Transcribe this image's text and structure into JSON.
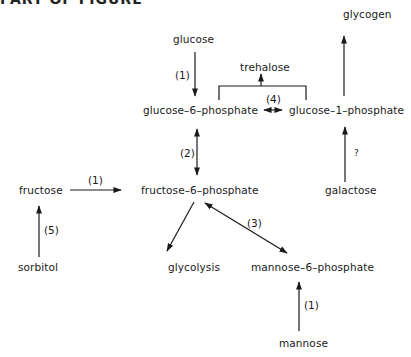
{
  "figure": {
    "header_fragment": "PART OF FIGURE"
  },
  "nodes": {
    "glycogen": "glycogen",
    "glucose": "glucose",
    "trehalose": "trehalose",
    "glucose_6_phosphate": "glucose–6–phosphate",
    "glucose_1_phosphate": "glucose–1–phosphate",
    "fructose": "fructose",
    "fructose_6_phosphate": "fructose–6–phosphate",
    "galactose": "galactose",
    "sorbitol": "sorbitol",
    "glycolysis": "glycolysis",
    "mannose_6_phosphate": "mannose–6–phosphate",
    "mannose": "mannose"
  },
  "edge_labels": {
    "glucose_to_g6p": "(1)",
    "g6p_g1p": "(4)",
    "g6p_f6p": "(2)",
    "fructose_to_f6p": "(1)",
    "sorbitol_to_fructose": "(5)",
    "f6p_m6p": "(3)",
    "galactose_to_g1p": "?",
    "mannose_to_m6p": "(1)"
  },
  "edges": [
    {
      "from": "glucose",
      "to": "glucose-6-phosphate",
      "label": "(1)",
      "direction": "forward"
    },
    {
      "from": "glucose-6-phosphate",
      "to": "glucose-1-phosphate",
      "label": "(4)",
      "direction": "bidirectional"
    },
    {
      "from": "glucose-6-phosphate + glucose-1-phosphate",
      "to": "trehalose",
      "label": "",
      "direction": "forward"
    },
    {
      "from": "glucose-1-phosphate",
      "to": "glycogen",
      "label": "",
      "direction": "forward"
    },
    {
      "from": "galactose",
      "to": "glucose-1-phosphate",
      "label": "?",
      "direction": "forward"
    },
    {
      "from": "glucose-6-phosphate",
      "to": "fructose-6-phosphate",
      "label": "(2)",
      "direction": "bidirectional"
    },
    {
      "from": "fructose",
      "to": "fructose-6-phosphate",
      "label": "(1)",
      "direction": "forward"
    },
    {
      "from": "sorbitol",
      "to": "fructose",
      "label": "(5)",
      "direction": "forward"
    },
    {
      "from": "fructose-6-phosphate",
      "to": "glycolysis",
      "label": "",
      "direction": "forward"
    },
    {
      "from": "fructose-6-phosphate",
      "to": "mannose-6-phosphate",
      "label": "(3)",
      "direction": "bidirectional"
    },
    {
      "from": "mannose",
      "to": "mannose-6-phosphate",
      "label": "(1)",
      "direction": "forward"
    }
  ],
  "colors": {
    "ink": "#1a1a1a",
    "background": "#ffffff"
  }
}
